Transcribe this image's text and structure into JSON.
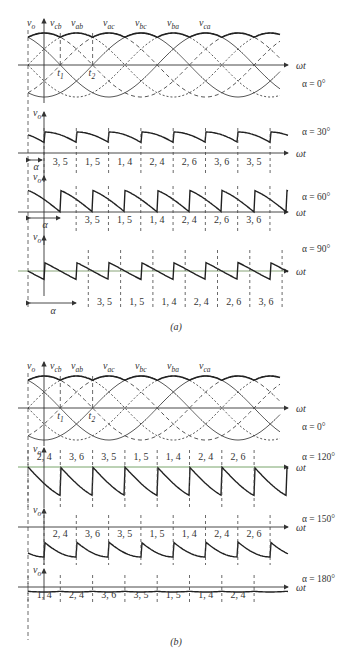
{
  "figure": {
    "caption_a": "(a)",
    "caption_b": "(b)",
    "axis_y": "v",
    "axis_y_sub": "o",
    "axis_x": "ωt",
    "t1": "t",
    "t1_sub": "1",
    "t2": "t",
    "t2_sub": "2",
    "alpha_symbol": "α"
  },
  "phase_labels": [
    {
      "base": "v",
      "sub": "cb"
    },
    {
      "base": "v",
      "sub": "ab"
    },
    {
      "base": "v",
      "sub": "ac"
    },
    {
      "base": "v",
      "sub": "bc"
    },
    {
      "base": "v",
      "sub": "ba"
    },
    {
      "base": "v",
      "sub": "ca"
    }
  ],
  "panels": [
    {
      "id": "a0",
      "alpha_label": "α = 0°",
      "segments": []
    },
    {
      "id": "a30",
      "alpha_label": "α = 30°",
      "segments": [
        "3, 5",
        "1, 5",
        "1, 4",
        "2, 4",
        "2, 6",
        "3, 6",
        "3, 5"
      ]
    },
    {
      "id": "a60",
      "alpha_label": "α = 60°",
      "segments": [
        "3, 5",
        "1, 5",
        "1, 4",
        "2, 4",
        "2, 6",
        "3, 6"
      ]
    },
    {
      "id": "a90",
      "alpha_label": "α = 90°",
      "segments": [
        "3, 5",
        "1, 5",
        "1, 4",
        "2, 4",
        "2, 6",
        "3, 6"
      ]
    },
    {
      "id": "b0",
      "alpha_label": "α = 0°",
      "segments": []
    },
    {
      "id": "b120",
      "alpha_label": "α = 120°",
      "segments": [
        "2, 4",
        "3, 6",
        "3, 5",
        "1, 5",
        "1, 4",
        "2, 4",
        "2, 6"
      ]
    },
    {
      "id": "b150",
      "alpha_label": "α = 150°",
      "segments": [
        "2, 4",
        "3, 6",
        "3, 5",
        "1, 5",
        "1, 4",
        "2, 4",
        "2, 6"
      ]
    },
    {
      "id": "b180",
      "alpha_label": "α = 180°",
      "segments": [
        "1, 4",
        "2, 4",
        "3, 6",
        "3, 5",
        "1, 5",
        "1, 4",
        "2, 4"
      ]
    }
  ]
}
